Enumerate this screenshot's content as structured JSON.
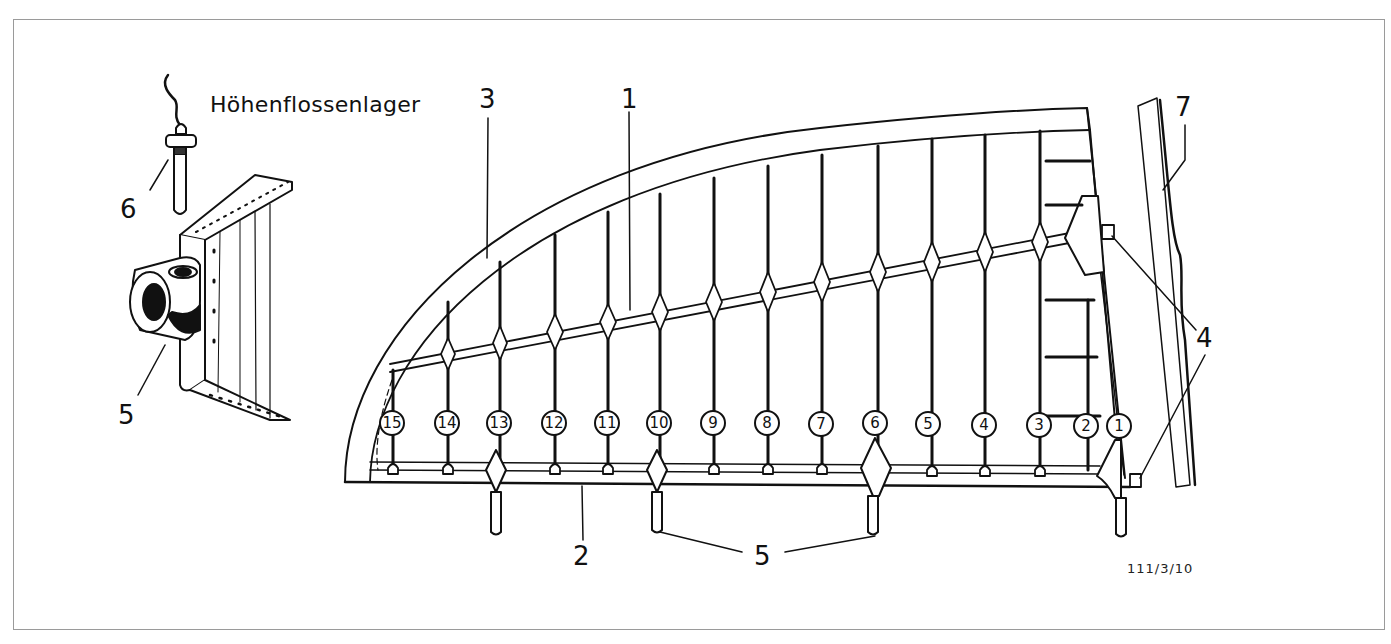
{
  "figure": {
    "title": "Höhenflossenlager",
    "figure_id": "111/3/10",
    "frame_color": "#9a9a9a",
    "line_color": "#111111"
  },
  "callouts": {
    "c1": "1",
    "c2": "2",
    "c3": "3",
    "c4": "4",
    "c5_main": "5",
    "c5_detail": "5",
    "c6": "6",
    "c7": "7"
  },
  "ribs": [
    {
      "number": "15"
    },
    {
      "number": "14"
    },
    {
      "number": "13"
    },
    {
      "number": "12"
    },
    {
      "number": "11"
    },
    {
      "number": "10"
    },
    {
      "number": "9"
    },
    {
      "number": "8"
    },
    {
      "number": "7"
    },
    {
      "number": "6"
    },
    {
      "number": "5"
    },
    {
      "number": "4"
    },
    {
      "number": "3"
    },
    {
      "number": "2"
    },
    {
      "number": "1"
    }
  ]
}
